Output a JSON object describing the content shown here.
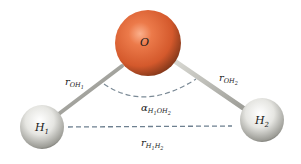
{
  "diagram": {
    "atoms": [
      {
        "id": "O",
        "label": "O",
        "subscript": "",
        "color": "#e0673a",
        "cx": 148,
        "cy": 43,
        "r": 33
      },
      {
        "id": "H1",
        "label": "H",
        "subscript": "1",
        "color": "#e6e6e2",
        "cx": 42,
        "cy": 127,
        "r": 22
      },
      {
        "id": "H2",
        "label": "H",
        "subscript": "2",
        "color": "#e6e6e2",
        "cx": 262,
        "cy": 120,
        "r": 22
      }
    ],
    "bonds": [
      {
        "from": "O",
        "to": "H1",
        "color": "#9a9a94"
      },
      {
        "from": "O",
        "to": "H2",
        "color": "#b4b4ae"
      }
    ],
    "labels": {
      "r_oh1": {
        "main": "r",
        "sub": "OH",
        "subsub": "1"
      },
      "r_oh2": {
        "main": "r",
        "sub": "OH",
        "subsub": "2"
      },
      "alpha": {
        "main": "α",
        "sub": "H",
        "sub1": "1",
        "sub2": "OH",
        "sub3": "2"
      },
      "r_h1h2": {
        "main": "r",
        "sub": "H",
        "sub1": "1",
        "sub2": "H",
        "sub3": "2"
      }
    },
    "dash_color": "#7b8a96"
  }
}
